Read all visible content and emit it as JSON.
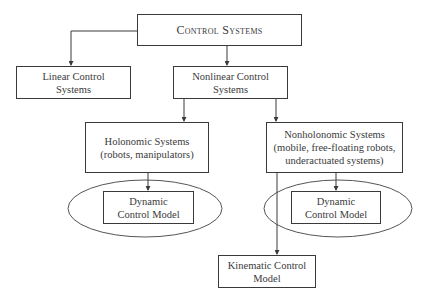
{
  "diagram": {
    "root": {
      "lines": [
        "Control Systems"
      ]
    },
    "linear": {
      "lines": [
        "Linear Control",
        "Systems"
      ]
    },
    "nonlinear": {
      "lines": [
        "Nonlinear Control",
        "Systems"
      ]
    },
    "holonomic": {
      "lines": [
        "Holonomic Systems",
        "(robots, manipulators)"
      ]
    },
    "nonholonomic": {
      "lines": [
        "Nonholonomic Systems",
        "(mobile, free-floating robots,",
        "underactuated systems)"
      ]
    },
    "dynamic_left": {
      "lines": [
        "Dynamic",
        "Control Model"
      ]
    },
    "dynamic_right": {
      "lines": [
        "Dynamic",
        "Control Model"
      ]
    },
    "kinematic": {
      "lines": [
        "Kinematic Control",
        "Model"
      ]
    },
    "edges": [
      [
        "Control Systems",
        "Linear Control Systems"
      ],
      [
        "Control Systems",
        "Nonlinear Control Systems"
      ],
      [
        "Nonlinear Control Systems",
        "Holonomic Systems"
      ],
      [
        "Nonlinear Control Systems",
        "Nonholonomic Systems"
      ],
      [
        "Holonomic Systems",
        "Dynamic Control Model"
      ],
      [
        "Nonholonomic Systems",
        "Dynamic Control Model"
      ],
      [
        "Nonholonomic Systems",
        "Kinematic Control Model"
      ]
    ]
  }
}
